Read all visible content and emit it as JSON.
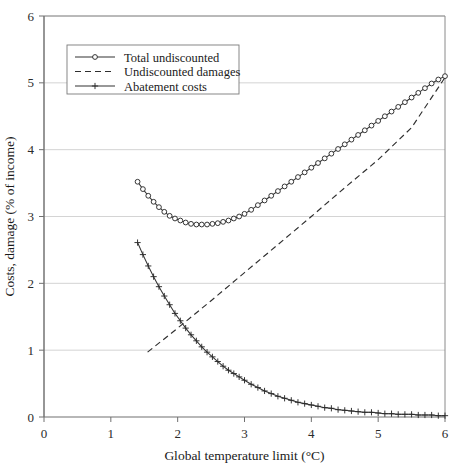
{
  "chart_data": {
    "type": "line",
    "title": "",
    "xlabel": "Global temperature limit (°C)",
    "ylabel": "Costs, damage (% of income)",
    "xlim": [
      0,
      6
    ],
    "ylim": [
      0,
      6
    ],
    "xticks": [
      "0",
      "1",
      "2",
      "3",
      "4",
      "5",
      "6"
    ],
    "yticks": [
      "0",
      "1",
      "2",
      "3",
      "4",
      "5",
      "6"
    ],
    "grid": "horizontal",
    "legend_position": "upper-left-inside",
    "series": [
      {
        "name": "Total undiscounted",
        "marker": "circle",
        "linestyle": "solid",
        "x": [
          1.4,
          1.48,
          1.56,
          1.64,
          1.72,
          1.8,
          1.88,
          1.96,
          2.04,
          2.12,
          2.2,
          2.28,
          2.36,
          2.44,
          2.52,
          2.6,
          2.68,
          2.76,
          2.84,
          2.92,
          3.0,
          3.1,
          3.2,
          3.3,
          3.4,
          3.5,
          3.6,
          3.7,
          3.8,
          3.9,
          4.0,
          4.1,
          4.2,
          4.3,
          4.4,
          4.5,
          4.6,
          4.7,
          4.8,
          4.9,
          5.0,
          5.1,
          5.2,
          5.3,
          5.4,
          5.5,
          5.6,
          5.7,
          5.8,
          5.9,
          6.0
        ],
        "y": [
          3.52,
          3.41,
          3.31,
          3.22,
          3.14,
          3.07,
          3.01,
          2.97,
          2.94,
          2.91,
          2.89,
          2.88,
          2.88,
          2.88,
          2.89,
          2.9,
          2.92,
          2.94,
          2.97,
          3.0,
          3.04,
          3.1,
          3.17,
          3.24,
          3.31,
          3.38,
          3.45,
          3.52,
          3.59,
          3.66,
          3.73,
          3.8,
          3.87,
          3.94,
          4.01,
          4.08,
          4.15,
          4.22,
          4.29,
          4.36,
          4.43,
          4.5,
          4.57,
          4.64,
          4.71,
          4.78,
          4.85,
          4.92,
          4.99,
          5.05,
          5.1
        ]
      },
      {
        "name": "Undiscounted damages",
        "marker": "none",
        "linestyle": "dashed",
        "x": [
          1.55,
          2.0,
          2.5,
          3.0,
          3.5,
          4.0,
          4.5,
          5.0,
          5.5,
          6.0
        ],
        "y": [
          0.97,
          1.33,
          1.74,
          2.16,
          2.58,
          3.0,
          3.43,
          3.85,
          4.33,
          5.08
        ]
      },
      {
        "name": "Abatement costs",
        "marker": "plus",
        "linestyle": "solid",
        "x": [
          1.4,
          1.48,
          1.56,
          1.64,
          1.72,
          1.8,
          1.88,
          1.96,
          2.04,
          2.12,
          2.2,
          2.28,
          2.36,
          2.44,
          2.52,
          2.6,
          2.68,
          2.76,
          2.84,
          2.92,
          3.0,
          3.1,
          3.2,
          3.3,
          3.4,
          3.5,
          3.6,
          3.7,
          3.8,
          3.9,
          4.0,
          4.1,
          4.2,
          4.3,
          4.4,
          4.5,
          4.6,
          4.7,
          4.8,
          4.9,
          5.0,
          5.1,
          5.2,
          5.3,
          5.4,
          5.5,
          5.6,
          5.7,
          5.8,
          5.9,
          6.0
        ],
        "y": [
          2.61,
          2.43,
          2.26,
          2.1,
          1.95,
          1.81,
          1.68,
          1.55,
          1.44,
          1.33,
          1.23,
          1.14,
          1.05,
          0.97,
          0.9,
          0.83,
          0.76,
          0.7,
          0.65,
          0.6,
          0.55,
          0.49,
          0.44,
          0.39,
          0.35,
          0.31,
          0.28,
          0.25,
          0.22,
          0.2,
          0.18,
          0.16,
          0.14,
          0.13,
          0.11,
          0.1,
          0.09,
          0.08,
          0.07,
          0.07,
          0.06,
          0.05,
          0.05,
          0.04,
          0.04,
          0.04,
          0.03,
          0.03,
          0.03,
          0.02,
          0.02
        ]
      }
    ],
    "colors": {
      "line": "#2b2b2b",
      "grid": "#cfcfcf",
      "axis": "#707070",
      "background": "#ffffff"
    }
  },
  "legend": {
    "entries": [
      {
        "label": "Total undiscounted"
      },
      {
        "label": "Undiscounted damages"
      },
      {
        "label": "Abatement costs"
      }
    ]
  }
}
